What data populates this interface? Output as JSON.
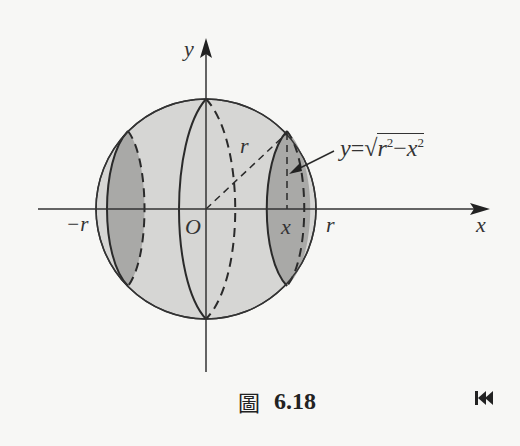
{
  "figure": {
    "axes": {
      "x_label": "x",
      "y_label": "y",
      "origin_label": "O",
      "neg_r_label": "−r",
      "pos_r_label": "r",
      "x_mark_label": "x",
      "radius_label": "r"
    },
    "formula": {
      "lhs": "y",
      "eq": "=",
      "sqrt_symbol": "√",
      "r": "r",
      "r_exp": "2",
      "minus": "−",
      "x": "x",
      "x_exp": "2"
    },
    "colors": {
      "sphere_fill": "#d6d6d4",
      "cross_section_fill": "#a9a9a7",
      "line": "#2a2a2a",
      "background": "#f7f7f5"
    }
  },
  "caption": {
    "figure_char": "圖",
    "figure_number": "6.18"
  },
  "navigation": {
    "back_icon": "⏮"
  }
}
